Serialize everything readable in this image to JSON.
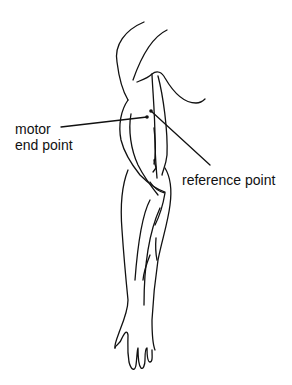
{
  "diagram": {
    "labels": {
      "motor_end_point_line1": "motor",
      "motor_end_point_line2": "end point",
      "reference_point": "reference point"
    },
    "points": [
      {
        "name": "motor end point",
        "x": 147,
        "y": 117
      },
      {
        "name": "reference point",
        "x": 151,
        "y": 111
      }
    ],
    "colors": {
      "stroke": "#111111",
      "background": "#ffffff"
    }
  }
}
